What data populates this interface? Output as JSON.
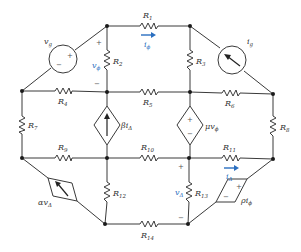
{
  "diagram": {
    "type": "electrical-circuit",
    "colors": {
      "wire": "#3a3a3a",
      "node": "#1a1a1a",
      "label": "#333333",
      "accent_blue": "#2a6fc0"
    },
    "resistors": [
      {
        "id": "R1",
        "name": "R",
        "sub": "1"
      },
      {
        "id": "R2",
        "name": "R",
        "sub": "2"
      },
      {
        "id": "R3",
        "name": "R",
        "sub": "3"
      },
      {
        "id": "R4",
        "name": "R",
        "sub": "4"
      },
      {
        "id": "R5",
        "name": "R",
        "sub": "5"
      },
      {
        "id": "R6",
        "name": "R",
        "sub": "6"
      },
      {
        "id": "R7",
        "name": "R",
        "sub": "7"
      },
      {
        "id": "R8",
        "name": "R",
        "sub": "8"
      },
      {
        "id": "R9",
        "name": "R",
        "sub": "9"
      },
      {
        "id": "R10",
        "name": "R",
        "sub": "10"
      },
      {
        "id": "R11",
        "name": "R",
        "sub": "11"
      },
      {
        "id": "R12",
        "name": "R",
        "sub": "12"
      },
      {
        "id": "R13",
        "name": "R",
        "sub": "13"
      },
      {
        "id": "R14",
        "name": "R",
        "sub": "14"
      }
    ],
    "independent_sources": {
      "voltage": {
        "name": "v",
        "sub": "g",
        "plus": "+",
        "minus": "−"
      },
      "current": {
        "name": "i",
        "sub": "g"
      }
    },
    "dependent_sources": {
      "beta": {
        "coef": "β",
        "var": "i",
        "sub": "Δ",
        "kind": "current"
      },
      "mu": {
        "coef": "μ",
        "var": "v",
        "sub": "ϕ",
        "kind": "voltage",
        "plus": "+",
        "minus": "−"
      },
      "alpha": {
        "coef": "α",
        "var": "v",
        "sub": "Δ",
        "kind": "current"
      },
      "rho": {
        "coef": "ρ",
        "var": "i",
        "sub": "ϕ",
        "kind": "voltage",
        "plus": "+",
        "minus": "−"
      }
    },
    "controlling_variables": {
      "v_phi": {
        "name": "v",
        "sub": "ϕ",
        "plus": "+",
        "minus": "−"
      },
      "i_phi": {
        "name": "i",
        "sub": "ϕ"
      },
      "v_delta": {
        "name": "v",
        "sub": "Δ",
        "plus": "+",
        "minus": "−"
      },
      "i_delta": {
        "name": "i",
        "sub": "Δ"
      }
    }
  }
}
